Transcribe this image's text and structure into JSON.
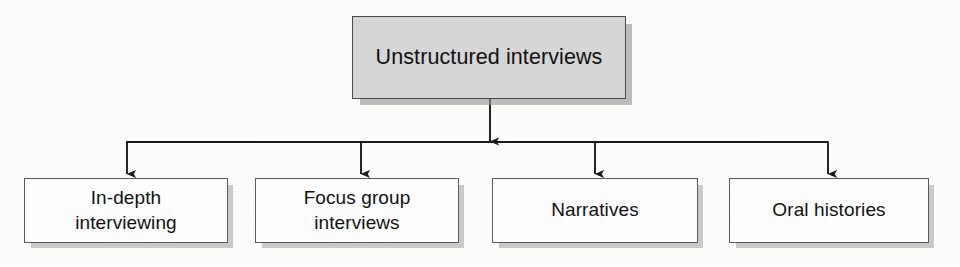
{
  "diagram": {
    "type": "hierarchy-tree",
    "orientation": "top-down",
    "root": {
      "id": "root",
      "label": "Unstructured interviews",
      "fill_color": "#d7d7d7",
      "border_color": "#4a4a4a",
      "text_color": "#111111",
      "has_drop_shadow": true
    },
    "children": [
      {
        "id": "leaf-0",
        "label": "In-depth\ninterviewing",
        "fill_color": "#ffffff",
        "border_color": "#5a5a5a",
        "text_color": "#111111",
        "has_drop_shadow": true
      },
      {
        "id": "leaf-1",
        "label": "Focus group\ninterviews",
        "fill_color": "#ffffff",
        "border_color": "#5a5a5a",
        "text_color": "#111111",
        "has_drop_shadow": true
      },
      {
        "id": "leaf-2",
        "label": "Narratives",
        "fill_color": "#ffffff",
        "border_color": "#5a5a5a",
        "text_color": "#111111",
        "has_drop_shadow": true
      },
      {
        "id": "leaf-3",
        "label": "Oral histories",
        "fill_color": "#ffffff",
        "border_color": "#5a5a5a",
        "text_color": "#111111",
        "has_drop_shadow": true
      }
    ],
    "connectors": {
      "line_color": "#1a1a1a",
      "arrowhead_style": "solid-triangle",
      "bus_y": 142,
      "root_stem_x": 490,
      "branch_stem_x": [
        127,
        361,
        595,
        828
      ]
    },
    "background_color": "#fdfdfc"
  }
}
